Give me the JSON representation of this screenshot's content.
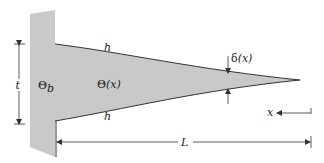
{
  "diagram": {
    "labels": {
      "thickness": "t",
      "base_temp": "Θ",
      "base_temp_sub": "b",
      "local_temp": "Θ(x)",
      "local_temp_theta": "Θ",
      "local_temp_arg": "(x)",
      "h_top": "h",
      "h_bottom": "h",
      "half_thickness": "δ(x)",
      "half_thickness_delta": "δ",
      "half_thickness_arg": "(x)",
      "coordinate": "x",
      "length": "L"
    },
    "colors": {
      "fill": "#c9c9c9",
      "stroke": "#333333",
      "background": "#ffffff"
    }
  }
}
